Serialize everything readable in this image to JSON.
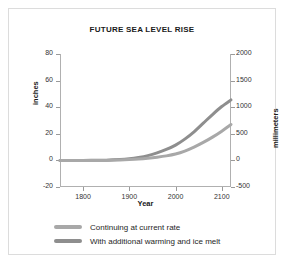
{
  "chart_data": {
    "type": "line",
    "title": "FUTURE SEA LEVEL RISE",
    "xlabel": "Year",
    "ylabel": "inches",
    "ylabel_right": "millimeters",
    "xlim": [
      1750,
      2120
    ],
    "ylim": [
      -20,
      80
    ],
    "ylim_right": [
      -500,
      2000
    ],
    "grid": false,
    "legend_position": "below",
    "xticks": [
      "1800",
      "1900",
      "2000",
      "2100"
    ],
    "xtick_values": [
      1800,
      1900,
      2000,
      2100
    ],
    "yticks_left": [
      "80",
      "60",
      "40",
      "20",
      "0",
      "-20"
    ],
    "ytick_values_left": [
      80,
      60,
      40,
      20,
      0,
      -20
    ],
    "yticks_right": [
      "2000",
      "1500",
      "1000",
      "500",
      "0",
      "-500"
    ],
    "ytick_values_right": [
      2000,
      1500,
      1000,
      500,
      0,
      -500
    ],
    "series": [
      {
        "name": "Continuing at current rate",
        "color": "#a8a8a8",
        "x": [
          1750,
          1800,
          1850,
          1880,
          1900,
          1920,
          1940,
          1960,
          1980,
          2000,
          2020,
          2040,
          2060,
          2080,
          2100,
          2120
        ],
        "values": [
          0,
          0,
          0,
          0.3,
          0.6,
          1.0,
          1.6,
          2.4,
          3.4,
          4.8,
          7.0,
          10.0,
          13.5,
          17.5,
          22.0,
          27.0
        ]
      },
      {
        "name": "With additional warming and ice melt",
        "color": "#8e8e8e",
        "x": [
          1750,
          1800,
          1850,
          1880,
          1900,
          1920,
          1940,
          1960,
          1980,
          2000,
          2020,
          2040,
          2060,
          2080,
          2100,
          2120
        ],
        "values": [
          0,
          0,
          0.2,
          0.6,
          1.2,
          2.2,
          3.6,
          5.6,
          8.2,
          11.5,
          16.0,
          21.5,
          28.0,
          34.5,
          40.5,
          45.5
        ]
      }
    ]
  },
  "legend": {
    "items": [
      {
        "label": "Continuing at current rate",
        "color": "#a8a8a8"
      },
      {
        "label": "With additional warming and ice melt",
        "color": "#8e8e8e"
      }
    ]
  }
}
